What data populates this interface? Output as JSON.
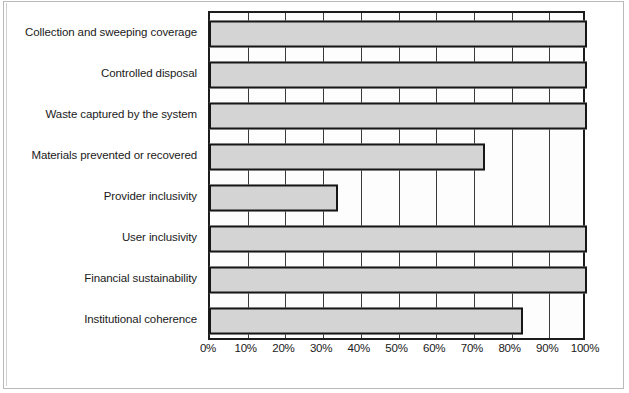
{
  "chart_data": {
    "type": "bar",
    "orientation": "horizontal",
    "title": "",
    "subtitle": "",
    "xlabel": "",
    "ylabel": "",
    "xlim": [
      0,
      100
    ],
    "x_tick_labels": [
      "0%",
      "10%",
      "20%",
      "30%",
      "40%",
      "50%",
      "60%",
      "70%",
      "80%",
      "90%",
      "100%"
    ],
    "x_tick_values": [
      0,
      10,
      20,
      30,
      40,
      50,
      60,
      70,
      80,
      90,
      100
    ],
    "grid": true,
    "grid_axis": "x",
    "legend": false,
    "legend_position": "none",
    "categories": [
      "Collection and sweeping coverage",
      "Controlled disposal",
      "Waste captured by the system",
      "Materials prevented or recovered",
      "Provider inclusivity",
      "User inclusivity",
      "Financial sustainability",
      "Institutional coherence"
    ],
    "values": [
      100,
      100,
      100,
      73,
      34,
      100,
      100,
      83
    ],
    "value_labels": [
      "100%",
      "100%",
      "100%",
      "73%",
      "34%",
      "100%",
      "100%",
      "83%"
    ],
    "series": [
      {
        "name": "Score",
        "values": [
          100,
          100,
          100,
          73,
          34,
          100,
          100,
          83
        ]
      }
    ],
    "colors": {
      "bar_fill": "#d4d4d4",
      "bar_edge": "#171717",
      "plot_background": "#fdfdfd",
      "grid": "#3a3a3a",
      "axis": "#1c1c1c",
      "text": "#1a1a1a",
      "page_background": "#ffffff",
      "frame": "#b9b9b9"
    }
  }
}
